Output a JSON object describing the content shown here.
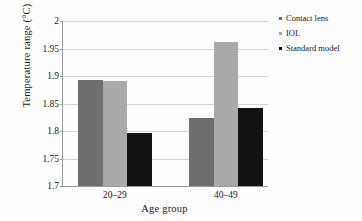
{
  "chart_data": {
    "type": "bar",
    "title": "",
    "xlabel": "Age group",
    "ylabel": "Temperature range (°C)",
    "categories": [
      "20–29",
      "40–49"
    ],
    "ylim": [
      1.7,
      2
    ],
    "yticks": [
      "1.7",
      "1.75",
      "1.8",
      "1.85",
      "1.9",
      "1.95",
      "2"
    ],
    "ytick_values": [
      1.7,
      1.75,
      1.8,
      1.85,
      1.9,
      1.95,
      2.0
    ],
    "grid": true,
    "legend_position": "right",
    "series": [
      {
        "name": "Contact lens",
        "color": "#6e6e6e",
        "values": [
          1.893,
          1.823
        ]
      },
      {
        "name": "IOL",
        "color": "#a9a9a9",
        "values": [
          1.891,
          1.962
        ]
      },
      {
        "name": "Standard model",
        "color": "#121212",
        "values": [
          1.796,
          1.841
        ]
      }
    ]
  },
  "legend": {
    "items": [
      {
        "label": "Contact lens",
        "color": "#6e6e6e"
      },
      {
        "label": "IOL",
        "color": "#a9a9a9"
      },
      {
        "label": "Standard model",
        "color": "#121212"
      }
    ]
  }
}
